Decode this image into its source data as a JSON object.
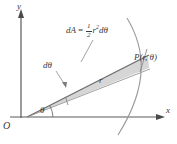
{
  "figure": {
    "type": "polar-area-element-diagram",
    "axes": {
      "y_label": "y",
      "x_label": "x",
      "origin_label": "O"
    },
    "labels": {
      "angle": "θ",
      "angle_increment": "dθ",
      "radius": "r",
      "point": "P(r, θ)"
    },
    "formula": {
      "lhs": "dA",
      "equals": "=",
      "numerator": "1",
      "denominator": "2",
      "radius_symbol": "r",
      "exponent": "2",
      "differential": "dθ"
    },
    "colors": {
      "line": "#6e6e6e",
      "axis": "#5a5a5a",
      "text": "#3a3a3a",
      "wedge_fill": "#d6d6d6",
      "curve": "#9a9a9a",
      "background": "#ffffff"
    },
    "geometry": {
      "origin_px": [
        27,
        117
      ],
      "point_px": [
        143,
        60
      ],
      "theta_degrees": 26,
      "dtheta_degrees": 9
    }
  }
}
